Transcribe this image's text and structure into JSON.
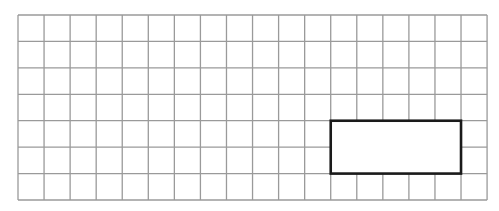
{
  "diagram": {
    "type": "grid-with-rectangle",
    "grid": {
      "columns": 18,
      "rows": 7,
      "origin_x": 18,
      "origin_y": 15,
      "cell_width": 26.06,
      "cell_height": 26.43,
      "line_color": "#9a9a9a",
      "line_width": 1.3
    },
    "rectangle": {
      "col_start": 12,
      "row_start": 4,
      "width_cells": 5,
      "height_cells": 2,
      "stroke_color": "#1a1a1a",
      "stroke_width": 2.6,
      "fill": "#ffffff"
    }
  }
}
